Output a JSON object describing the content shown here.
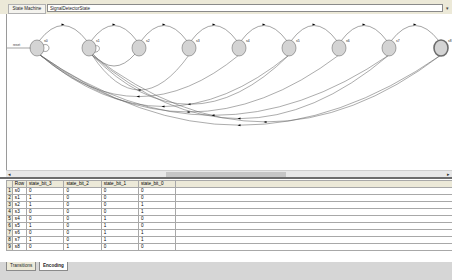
{
  "toolbar": {
    "label": "State Machine",
    "name_value": "SignalDetectorState",
    "dropdown_glyph": "▾"
  },
  "diagram": {
    "initial_label": "reset",
    "states": [
      {
        "id": "s0",
        "x": 30,
        "y": 34
      },
      {
        "id": "s1",
        "x": 82,
        "y": 34
      },
      {
        "id": "s2",
        "x": 132,
        "y": 34
      },
      {
        "id": "s3",
        "x": 182,
        "y": 34
      },
      {
        "id": "s4",
        "x": 232,
        "y": 34
      },
      {
        "id": "s5",
        "x": 282,
        "y": 34
      },
      {
        "id": "s6",
        "x": 332,
        "y": 34
      },
      {
        "id": "s7",
        "x": 382,
        "y": 34
      },
      {
        "id": "s8",
        "x": 434,
        "y": 34
      }
    ],
    "final_state": "s8",
    "state_fill": "#d4d4d4",
    "state_stroke": "#6e6e6e",
    "edge_color": "#666666"
  },
  "hscroll": {
    "left": "◂",
    "right": "▸"
  },
  "table": {
    "headers": [
      "Row",
      "state_bit_3",
      "state_bit_2",
      "state_bit_1",
      "state_bit_0"
    ],
    "rows": [
      {
        "n": "1",
        "name": "s0",
        "b3": "0",
        "b2": "0",
        "b1": "0",
        "b0": "0"
      },
      {
        "n": "2",
        "name": "s1",
        "b3": "1",
        "b2": "0",
        "b1": "0",
        "b0": "0"
      },
      {
        "n": "3",
        "name": "s2",
        "b3": "1",
        "b2": "0",
        "b1": "0",
        "b0": "1"
      },
      {
        "n": "4",
        "name": "s3",
        "b3": "0",
        "b2": "0",
        "b1": "0",
        "b0": "1"
      },
      {
        "n": "5",
        "name": "s4",
        "b3": "0",
        "b2": "0",
        "b1": "1",
        "b0": "0"
      },
      {
        "n": "6",
        "name": "s5",
        "b3": "1",
        "b2": "0",
        "b1": "1",
        "b0": "0"
      },
      {
        "n": "7",
        "name": "s6",
        "b3": "0",
        "b2": "0",
        "b1": "1",
        "b0": "1"
      },
      {
        "n": "8",
        "name": "s7",
        "b3": "1",
        "b2": "0",
        "b1": "1",
        "b0": "1"
      },
      {
        "n": "9",
        "name": "s8",
        "b3": "0",
        "b2": "1",
        "b1": "0",
        "b0": "0"
      }
    ]
  },
  "tabs": [
    {
      "label": "Transitions",
      "active": false
    },
    {
      "label": "Encoding",
      "active": true
    }
  ]
}
